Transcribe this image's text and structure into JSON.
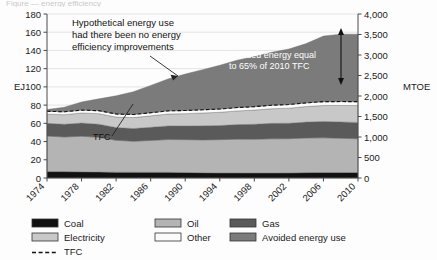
{
  "title_sliver": "Figure — energy efficiency",
  "chart_data": {
    "type": "area",
    "title": "",
    "xlabel": "",
    "ylabel": "EJ",
    "y2label": "MTOE",
    "xlim": [
      1974,
      2010
    ],
    "ylim": [
      0,
      180
    ],
    "y2lim": [
      0,
      4000
    ],
    "grid": true,
    "legend_position": "bottom",
    "x": [
      1974,
      1976,
      1978,
      1980,
      1982,
      1984,
      1986,
      1988,
      1990,
      1992,
      1994,
      1996,
      1998,
      2000,
      2002,
      2004,
      2006,
      2008,
      2010
    ],
    "yticks": [
      0,
      20,
      40,
      60,
      80,
      100,
      120,
      140,
      160,
      180
    ],
    "y2ticks": [
      0,
      500,
      1000,
      1500,
      2000,
      2500,
      3000,
      3500,
      4000
    ],
    "xticks": [
      1974,
      1978,
      1982,
      1986,
      1990,
      1994,
      1998,
      2002,
      2006,
      2010
    ],
    "series": [
      {
        "name": "Coal",
        "color": "#111111",
        "values": [
          7,
          7,
          6.8,
          6.6,
          6.4,
          6.3,
          6.2,
          6.2,
          6.1,
          5.8,
          5.6,
          5.6,
          5.5,
          5.5,
          5.6,
          5.9,
          6.1,
          6.1,
          6.0
        ]
      },
      {
        "name": "Oil",
        "color": "#b4b4b4",
        "values": [
          39,
          38,
          39,
          38,
          35,
          34,
          35,
          36,
          36,
          36,
          36.5,
          37,
          37,
          37.5,
          37.5,
          38,
          38,
          37.5,
          37
        ]
      },
      {
        "name": "Gas",
        "color": "#5a5a5a",
        "values": [
          14,
          14,
          14.5,
          14.5,
          14,
          14,
          14.5,
          15,
          15,
          15.5,
          15.5,
          16,
          16.5,
          17,
          17,
          17.5,
          18,
          18,
          18
        ]
      },
      {
        "name": "Electricity",
        "color": "#c8c8c8",
        "values": [
          10,
          10.5,
          11,
          11.5,
          11.5,
          12,
          12.5,
          13,
          13.5,
          14,
          14.5,
          15,
          15.5,
          16,
          16.5,
          17,
          17.5,
          18,
          18.5
        ]
      },
      {
        "name": "Other",
        "color": "#fbfbfb",
        "values": [
          3.2,
          3.2,
          3.2,
          3.3,
          3.3,
          3.4,
          3.4,
          3.5,
          3.5,
          3.6,
          3.6,
          3.7,
          3.8,
          3.9,
          4.0,
          4.1,
          4.2,
          4.3,
          4.3
        ]
      },
      {
        "name": "Avoided energy use",
        "color": "#7b7b7b",
        "values": [
          2,
          5,
          9,
          13,
          20,
          25,
          30,
          35,
          40,
          44,
          48,
          52,
          55,
          58,
          61,
          65,
          72,
          74,
          74
        ]
      }
    ],
    "tfc_line": {
      "name": "TFC",
      "style": "dashed",
      "values": [
        73.2,
        72.7,
        74.5,
        73.9,
        70.2,
        69.7,
        71.6,
        73.7,
        74.1,
        74.9,
        75.7,
        77.3,
        78.3,
        79.9,
        80.6,
        82.5,
        83.8,
        83.9,
        83.8
      ]
    },
    "annotations": [
      {
        "id": "hypothetical",
        "text": [
          "Hypothetical energy use",
          "had there been no energy",
          "efficiency improvements"
        ]
      },
      {
        "id": "avoided",
        "text": [
          "Avoided energy equal",
          "to 65% of 2010 TFC"
        ]
      },
      {
        "id": "tfc-callout",
        "text": "TFC"
      }
    ]
  },
  "legend": {
    "items": [
      {
        "label": "Coal",
        "color": "#111111",
        "type": "swatch"
      },
      {
        "label": "Oil",
        "color": "#b4b4b4",
        "type": "swatch"
      },
      {
        "label": "Gas",
        "color": "#5a5a5a",
        "type": "swatch"
      },
      {
        "label": "Electricity",
        "color": "#c8c8c8",
        "type": "swatch"
      },
      {
        "label": "Other",
        "color": "#fbfbfb",
        "type": "swatch"
      },
      {
        "label": "Avoided energy use",
        "color": "#7b7b7b",
        "type": "swatch"
      },
      {
        "label": "TFC",
        "color": "#111111",
        "type": "dashed"
      }
    ]
  }
}
